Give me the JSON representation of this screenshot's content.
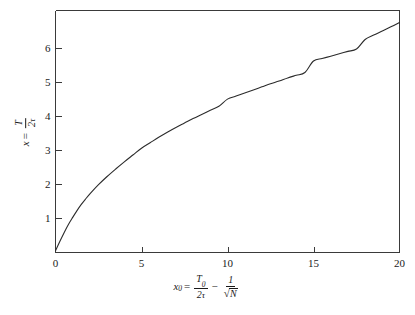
{
  "figure": {
    "background_color": "#ffffff",
    "line_color": "#2b2b2b",
    "axis_color": "#3a3a3a"
  },
  "axes": {
    "x": {
      "ticks": [
        0,
        5,
        10,
        15,
        20
      ],
      "tick_labels": [
        "0",
        "5",
        "10",
        "15",
        "20"
      ],
      "range": [
        0,
        20
      ],
      "label_parts": {
        "var": "x",
        "var_sub": "0",
        "equals": "=",
        "frac1_num": "T",
        "frac1_num_sub": "0",
        "frac1_den_coeff": "2",
        "frac1_den_sym": "τ",
        "minus": "−",
        "frac2_num": "1",
        "frac2_den_radicand": "N",
        "radical": "√"
      }
    },
    "y": {
      "ticks": [
        1,
        2,
        3,
        4,
        5,
        6
      ],
      "tick_labels": [
        "1",
        "2",
        "3",
        "4",
        "5",
        "6"
      ],
      "range": [
        0,
        7.1
      ],
      "label_parts": {
        "var": "x",
        "equals": "=",
        "frac_num": "T",
        "frac_den_coeff": "2",
        "frac_den_sym": "τ"
      }
    }
  },
  "chart_data": {
    "type": "line",
    "title": "",
    "xlabel": "x0 = T0/(2τ) − 1/√N",
    "ylabel": "x = T/(2τ)",
    "xlim": [
      0,
      20
    ],
    "ylim": [
      0,
      7.1
    ],
    "grid": false,
    "legend": "none",
    "series": [
      {
        "name": "x vs x0",
        "x": [
          0.0,
          0.25,
          0.5,
          0.75,
          1.0,
          1.25,
          1.5,
          1.75,
          2.0,
          2.5,
          3.0,
          3.5,
          4.0,
          4.5,
          5.0,
          5.5,
          6.0,
          6.5,
          7.0,
          7.5,
          8.0,
          8.5,
          9.0,
          9.5,
          10.0,
          10.5,
          11.0,
          11.5,
          12.0,
          12.5,
          13.0,
          13.5,
          14.0,
          14.5,
          15.0,
          15.5,
          16.0,
          16.5,
          17.0,
          17.5,
          18.0,
          18.5,
          19.0,
          19.5,
          20.0
        ],
        "y": [
          0.05,
          0.32,
          0.58,
          0.82,
          1.03,
          1.23,
          1.41,
          1.57,
          1.72,
          1.99,
          2.23,
          2.45,
          2.66,
          2.86,
          3.06,
          3.22,
          3.38,
          3.53,
          3.67,
          3.8,
          3.93,
          4.05,
          4.17,
          4.29,
          4.5,
          4.59,
          4.68,
          4.77,
          4.86,
          4.95,
          5.03,
          5.12,
          5.2,
          5.28,
          5.62,
          5.69,
          5.76,
          5.83,
          5.9,
          5.97,
          6.25,
          6.38,
          6.5,
          6.62,
          6.75
        ]
      }
    ]
  }
}
